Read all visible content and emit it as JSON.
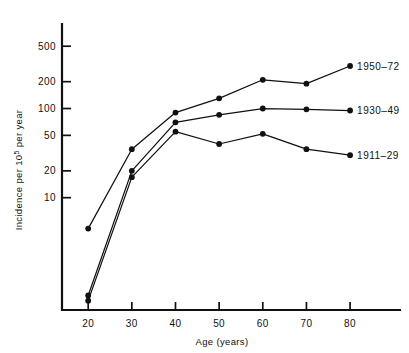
{
  "chart_data": {
    "type": "line",
    "title": "",
    "xlabel": "Age (years)",
    "ylabel": "Incidence per 10⁵ per year",
    "ylabel_parts": {
      "pre": "Incidence per 10",
      "sup": "5",
      "post": " per year"
    },
    "xscale": "linear",
    "yscale": "log",
    "xlim": [
      14,
      88
    ],
    "ylim": [
      0.55,
      800
    ],
    "grid": false,
    "legend_position": "right-inline",
    "x": [
      20,
      30,
      40,
      50,
      60,
      70,
      80
    ],
    "xticks": [
      20,
      30,
      40,
      50,
      60,
      70,
      80
    ],
    "xtick_labels": [
      "20",
      "30",
      "40",
      "50",
      "60",
      "70",
      "80"
    ],
    "yticks": [
      10,
      20,
      50,
      100,
      200,
      500
    ],
    "ytick_labels": [
      "10",
      "20",
      "50",
      "100",
      "200",
      "500"
    ],
    "series": [
      {
        "name": "1950-72",
        "label": "1950–72",
        "color": "#111111",
        "marker": "filled-circle",
        "values": [
          4.5,
          35,
          90,
          130,
          210,
          190,
          300
        ]
      },
      {
        "name": "1930-49",
        "label": "1930–49",
        "color": "#111111",
        "marker": "filled-circle",
        "values": [
          0.8,
          20,
          70,
          85,
          100,
          98,
          95
        ]
      },
      {
        "name": "1911-29",
        "label": "1911–29",
        "color": "#111111",
        "marker": "filled-circle",
        "values": [
          0.7,
          17,
          55,
          40,
          52,
          35,
          30
        ]
      }
    ],
    "annotations": [
      {
        "text": "1950–72",
        "attached_to": "1950-72",
        "at_x": 80
      },
      {
        "text": "1930–49",
        "attached_to": "1930-49",
        "at_x": 80
      },
      {
        "text": "1911–29",
        "attached_to": "1911-29",
        "at_x": 80
      }
    ]
  }
}
